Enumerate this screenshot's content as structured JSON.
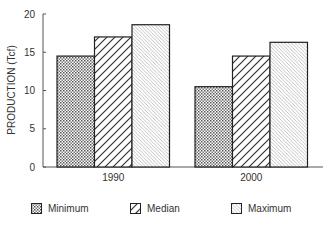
{
  "chart_data": {
    "type": "bar",
    "title": "",
    "xlabel": "",
    "ylabel": "PRODUCTION (Tcf)",
    "ylim": [
      0,
      20
    ],
    "yticks": [
      0,
      5,
      10,
      15,
      20
    ],
    "grid": false,
    "legend_position": "bottom",
    "categories": [
      "1990",
      "2000"
    ],
    "series": [
      {
        "name": "Minimum",
        "pattern": "dots",
        "values": [
          14.5,
          10.5
        ]
      },
      {
        "name": "Median",
        "pattern": "diagonal-up-bold",
        "values": [
          17.0,
          14.5
        ]
      },
      {
        "name": "Maximum",
        "pattern": "diagonal-down-fine",
        "values": [
          18.6,
          16.3
        ]
      }
    ]
  },
  "legend": {
    "items": [
      {
        "label": "Minimum",
        "pattern": "dots",
        "x": 31
      },
      {
        "label": "Median",
        "pattern": "diagonal-up-bold",
        "x": 130
      },
      {
        "label": "Maximum",
        "pattern": "diagonal-down-fine",
        "x": 231
      }
    ]
  },
  "colors": {
    "axis": "#555555",
    "bar_outline": "#222222",
    "dots": "#444444",
    "hatch_bold": "#333333",
    "hatch_fine": "#9a9a9a"
  }
}
